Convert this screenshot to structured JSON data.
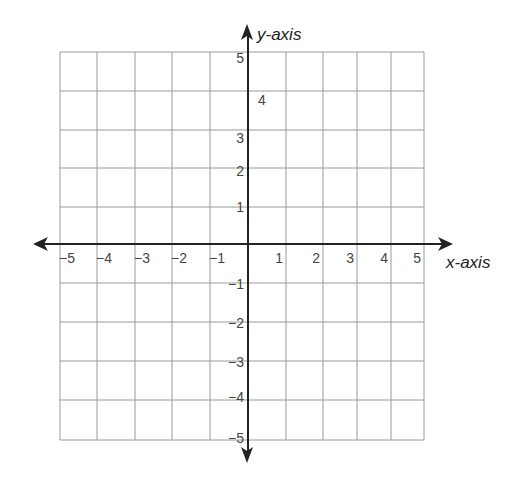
{
  "diagram": {
    "type": "coordinate-plane",
    "x_axis_label": "x-axis",
    "y_axis_label": "y-axis",
    "x_range": [
      -5,
      5
    ],
    "y_range": [
      -5,
      5
    ],
    "grid_step": 1,
    "x_tick_labels": [
      "−5",
      "−4",
      "−3",
      "−2",
      "−1",
      "1",
      "2",
      "3",
      "4",
      "5"
    ],
    "y_tick_labels": [
      "5",
      "4",
      "3",
      "2",
      "1",
      "−1",
      "−2",
      "−3",
      "−4",
      "−5"
    ],
    "colors": {
      "grid": "#9a9a9a",
      "axis": "#222222",
      "text": "#444444"
    }
  }
}
